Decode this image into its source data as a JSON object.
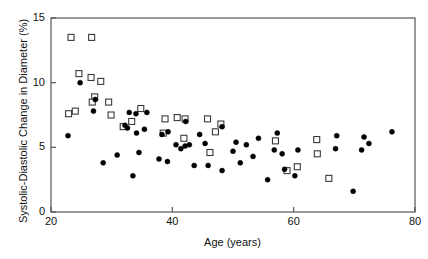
{
  "figure": {
    "background": "#ffffff",
    "frame_color": "#555555",
    "text_color": "#111111"
  },
  "chart_data": {
    "type": "scatter",
    "title": "",
    "xlabel": "Age (years)",
    "ylabel": "Systolic-Diastolic Change in Diameter (%)",
    "xlim": [
      20,
      80
    ],
    "ylim": [
      0,
      15
    ],
    "xticks": [
      20,
      40,
      60,
      80
    ],
    "yticks": [
      0,
      5,
      10,
      15
    ],
    "xtick_labels": [
      "20",
      "40",
      "60",
      "80"
    ],
    "ytick_labels": [
      "0",
      "5",
      "10",
      "15"
    ],
    "grid": false,
    "legend": "none",
    "legend_position": "none",
    "series": [
      {
        "name": "open-square-group",
        "marker": "open-square",
        "marker_color": "#ffffff",
        "marker_edge_color": "#3a3a3a",
        "marker_size": 6,
        "points": [
          [
            23.3,
            13.5
          ],
          [
            26.7,
            13.5
          ],
          [
            24.6,
            10.7
          ],
          [
            26.6,
            10.4
          ],
          [
            28.2,
            10.1
          ],
          [
            27.2,
            8.9
          ],
          [
            26.8,
            8.5
          ],
          [
            29.5,
            8.5
          ],
          [
            34.8,
            8.0
          ],
          [
            22.9,
            7.6
          ],
          [
            24.0,
            7.8
          ],
          [
            29.9,
            7.5
          ],
          [
            33.3,
            7.0
          ],
          [
            31.9,
            6.6
          ],
          [
            38.8,
            7.2
          ],
          [
            40.8,
            7.3
          ],
          [
            42.1,
            7.2
          ],
          [
            45.8,
            7.2
          ],
          [
            48.0,
            6.8
          ],
          [
            47.1,
            6.2
          ],
          [
            38.5,
            6.1
          ],
          [
            41.9,
            5.7
          ],
          [
            46.2,
            4.6
          ],
          [
            57.0,
            5.5
          ],
          [
            63.8,
            5.6
          ],
          [
            63.9,
            4.5
          ],
          [
            58.9,
            3.2
          ],
          [
            60.6,
            3.5
          ],
          [
            65.8,
            2.6
          ]
        ]
      },
      {
        "name": "filled-circle-group",
        "marker": "filled-circle",
        "marker_color": "#000000",
        "marker_edge_color": "#000000",
        "marker_size": 5,
        "points": [
          [
            24.8,
            10.0
          ],
          [
            27.3,
            8.7
          ],
          [
            27.0,
            7.8
          ],
          [
            22.8,
            5.9
          ],
          [
            32.9,
            7.7
          ],
          [
            34.0,
            7.6
          ],
          [
            35.8,
            7.7
          ],
          [
            32.2,
            6.7
          ],
          [
            32.6,
            6.5
          ],
          [
            34.1,
            6.1
          ],
          [
            35.4,
            6.4
          ],
          [
            39.3,
            6.2
          ],
          [
            38.3,
            6.0
          ],
          [
            42.2,
            7.0
          ],
          [
            44.5,
            6.0
          ],
          [
            48.2,
            6.6
          ],
          [
            40.6,
            5.2
          ],
          [
            41.4,
            4.9
          ],
          [
            42.1,
            5.1
          ],
          [
            42.8,
            5.2
          ],
          [
            45.4,
            5.3
          ],
          [
            50.5,
            5.4
          ],
          [
            52.2,
            5.2
          ],
          [
            54.2,
            5.7
          ],
          [
            57.3,
            6.1
          ],
          [
            56.8,
            4.8
          ],
          [
            58.1,
            4.5
          ],
          [
            60.7,
            4.8
          ],
          [
            66.9,
            4.9
          ],
          [
            67.1,
            5.9
          ],
          [
            71.6,
            5.8
          ],
          [
            72.4,
            5.3
          ],
          [
            71.2,
            4.8
          ],
          [
            76.2,
            6.2
          ],
          [
            28.6,
            3.8
          ],
          [
            30.9,
            4.4
          ],
          [
            34.5,
            4.6
          ],
          [
            33.5,
            2.8
          ],
          [
            37.8,
            4.1
          ],
          [
            39.2,
            3.9
          ],
          [
            43.6,
            3.6
          ],
          [
            45.9,
            3.6
          ],
          [
            48.2,
            3.2
          ],
          [
            50.0,
            4.7
          ],
          [
            51.2,
            3.8
          ],
          [
            53.3,
            4.3
          ],
          [
            55.7,
            2.5
          ],
          [
            58.5,
            3.3
          ],
          [
            60.2,
            2.8
          ],
          [
            69.8,
            1.6
          ]
        ]
      }
    ]
  },
  "axes": {
    "plot_left_px": 51,
    "plot_right_px": 415,
    "plot_top_px": 18,
    "plot_bottom_px": 212
  }
}
